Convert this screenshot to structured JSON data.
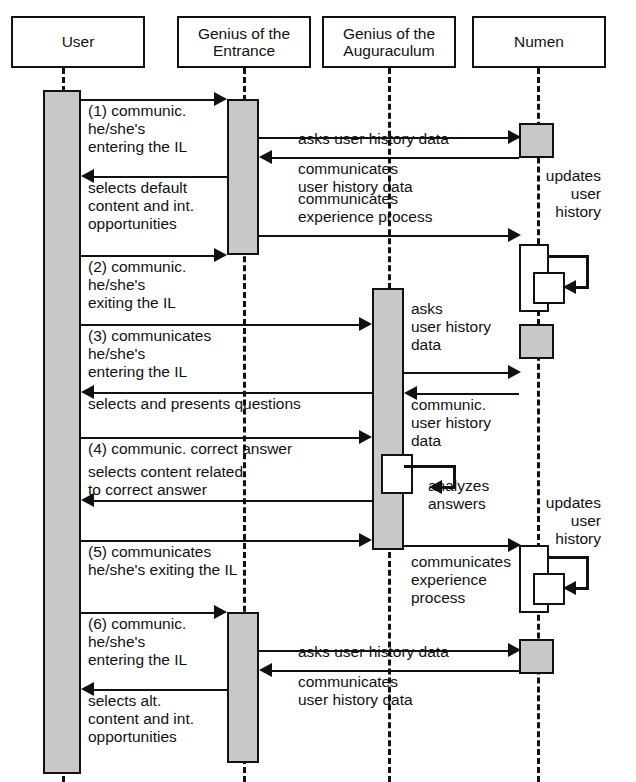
{
  "diagram": {
    "type": "uml-sequence-diagram",
    "title": "",
    "colors": {
      "line": "#111111",
      "activation_gray": "#c8c8c8",
      "activation_white": "#ffffff",
      "background": "#ffffff"
    }
  },
  "lifelines": [
    {
      "id": "user",
      "label": "User"
    },
    {
      "id": "entrance",
      "label": "Genius of the\nEntrance"
    },
    {
      "id": "auguraculum",
      "label": "Genius of the\nAuguraculum"
    },
    {
      "id": "numen",
      "label": "Numen"
    }
  ],
  "messages": [
    {
      "n": 1,
      "label": "(1) communic.\nhe/she's\nentering the IL",
      "from": "user",
      "to": "entrance"
    },
    {
      "n": 2,
      "label": "asks user history data",
      "from": "entrance",
      "to": "numen"
    },
    {
      "n": 3,
      "label": "communicates\nuser history data",
      "from": "numen",
      "to": "entrance"
    },
    {
      "n": 4,
      "label": "selects default\ncontent and int.\nopportunities",
      "from": "entrance",
      "to": "user"
    },
    {
      "n": 5,
      "label": "communicates\nexperience process",
      "from": "entrance",
      "to": "numen"
    },
    {
      "n": 6,
      "label": "updates\nuser\nhistory",
      "from": "numen",
      "to": "numen"
    },
    {
      "n": 7,
      "label": "(2) communic.\nhe/she's\nexiting the IL",
      "from": "user",
      "to": "entrance"
    },
    {
      "n": 8,
      "label": "(3) communicates\nhe/she's\nentering the IL",
      "from": "user",
      "to": "auguraculum"
    },
    {
      "n": 9,
      "label": "asks\nuser history\ndata",
      "from": "auguraculum",
      "to": "numen"
    },
    {
      "n": 10,
      "label": "communic.\nuser history\ndata",
      "from": "numen",
      "to": "auguraculum"
    },
    {
      "n": 11,
      "label": "selects and presents questions",
      "from": "auguraculum",
      "to": "user"
    },
    {
      "n": 12,
      "label": "(4) communic. correct answer",
      "from": "user",
      "to": "auguraculum"
    },
    {
      "n": 13,
      "label": "analyzes\nanswers",
      "from": "auguraculum",
      "to": "auguraculum"
    },
    {
      "n": 14,
      "label": "selects content related\nto correct answer",
      "from": "auguraculum",
      "to": "user"
    },
    {
      "n": 15,
      "label": "(5) communicates\nhe/she's exiting the IL",
      "from": "user",
      "to": "auguraculum"
    },
    {
      "n": 16,
      "label": "communicates\nexperience\nprocess",
      "from": "auguraculum",
      "to": "numen"
    },
    {
      "n": 17,
      "label": "updates\nuser\nhistory",
      "from": "numen",
      "to": "numen"
    },
    {
      "n": 18,
      "label": "(6) communic.\nhe/she's\nentering the IL",
      "from": "user",
      "to": "entrance"
    },
    {
      "n": 19,
      "label": "asks user history data",
      "from": "entrance",
      "to": "numen"
    },
    {
      "n": 20,
      "label": "communicates\nuser history data",
      "from": "numen",
      "to": "entrance"
    },
    {
      "n": 21,
      "label": "selects alt.\ncontent and int.\nopportunities",
      "from": "entrance",
      "to": "user"
    }
  ]
}
